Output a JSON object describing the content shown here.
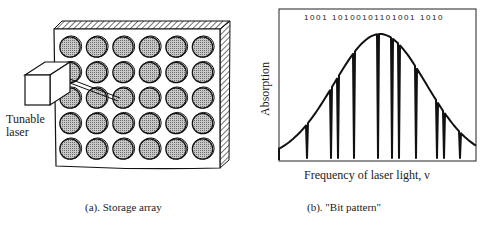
{
  "panel_a": {
    "laser_label_line1": "Tunable",
    "laser_label_line2": "laser",
    "caption": "(a).  Storage array",
    "grid": {
      "rows": 5,
      "cols": 6
    }
  },
  "panel_b": {
    "bit_pattern": "1001 10100101101001 1010",
    "y_axis_label": "Absorption",
    "x_axis_label": "Frequency of laser light, ν",
    "caption": "(b).  \"Bit pattern\""
  },
  "colors": {
    "line": "#111111",
    "cell_fill": "#a9a9a9",
    "background": "#ffffff"
  }
}
